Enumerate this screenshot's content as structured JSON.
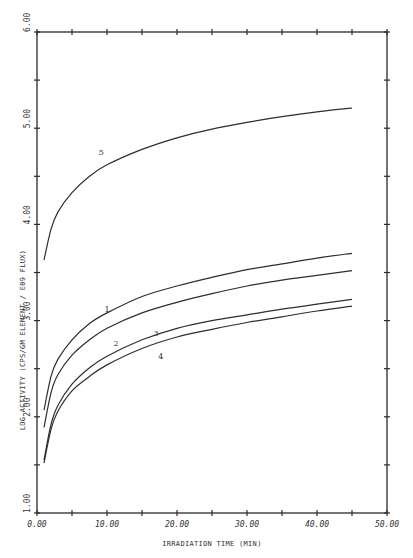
{
  "chart_data": {
    "type": "line",
    "title": "",
    "xlabel": "IRRADIATION TIME (MIN)",
    "ylabel": "LOG ACTIVITY (CPS/GM ELEMENT / E09 FLUX)",
    "xlim": [
      0,
      50
    ],
    "ylim": [
      1,
      6
    ],
    "x_ticks": [
      "0.00",
      "10.00",
      "20.00",
      "30.00",
      "40.00",
      "50.00"
    ],
    "y_ticks": [
      "1.00",
      "2.00",
      "3.00",
      "4.00",
      "5.00",
      "6.00"
    ],
    "minor_tick_step_x": 5,
    "minor_tick_step_y": 0.5,
    "grid": false,
    "legend": "inline curve labels",
    "series": [
      {
        "name": "5",
        "x": [
          1,
          2,
          3,
          5,
          7.5,
          10,
          15,
          20,
          25,
          30,
          35,
          40,
          45
        ],
        "values": [
          3.63,
          3.95,
          4.13,
          4.33,
          4.5,
          4.62,
          4.78,
          4.9,
          4.99,
          5.06,
          5.12,
          5.17,
          5.21
        ],
        "label_pos": [
          9.2,
          4.72
        ]
      },
      {
        "name": "1",
        "x": [
          1,
          2,
          3,
          5,
          7.5,
          10,
          15,
          20,
          25,
          30,
          35,
          40,
          45
        ],
        "values": [
          2.07,
          2.42,
          2.6,
          2.8,
          2.97,
          3.08,
          3.25,
          3.36,
          3.45,
          3.53,
          3.59,
          3.65,
          3.7
        ],
        "label_pos": [
          10,
          3.09
        ]
      },
      {
        "name": "2",
        "x": [
          1,
          2,
          3,
          5,
          7.5,
          10,
          15,
          20,
          25,
          30,
          35,
          40,
          45
        ],
        "values": [
          1.89,
          2.25,
          2.44,
          2.64,
          2.8,
          2.92,
          3.08,
          3.19,
          3.28,
          3.36,
          3.42,
          3.47,
          3.52
        ],
        "label_pos": [
          11.3,
          2.74
        ]
      },
      {
        "name": "3",
        "x": [
          1,
          2,
          3,
          5,
          7.5,
          10,
          15,
          20,
          25,
          30,
          35,
          40,
          45
        ],
        "values": [
          1.55,
          1.92,
          2.12,
          2.34,
          2.51,
          2.63,
          2.8,
          2.92,
          3.0,
          3.06,
          3.12,
          3.17,
          3.22
        ],
        "label_pos": [
          17,
          2.84
        ]
      },
      {
        "name": "4",
        "x": [
          1,
          2,
          3,
          5,
          7.5,
          10,
          15,
          20,
          25,
          30,
          35,
          40,
          45
        ],
        "values": [
          1.52,
          1.87,
          2.06,
          2.27,
          2.42,
          2.54,
          2.71,
          2.83,
          2.91,
          2.98,
          3.04,
          3.1,
          3.15
        ],
        "label_pos": [
          17.7,
          2.6
        ]
      }
    ]
  },
  "plot_area": {
    "left": 37,
    "top": 32,
    "right": 387,
    "bottom": 513
  }
}
